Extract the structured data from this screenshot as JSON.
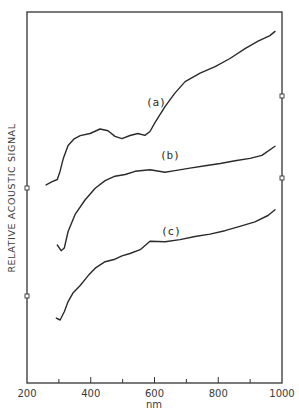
{
  "chart_data": {
    "type": "line",
    "title": "",
    "xlabel": "nm",
    "ylabel": "RELATIVE ACOUSTIC SIGNAL",
    "xlim": [
      200,
      1000
    ],
    "ylim": [
      0,
      100
    ],
    "x_ticks": [
      200,
      400,
      600,
      800,
      1000
    ],
    "x_tick_labels": [
      "200",
      "400",
      "600",
      "800",
      "1000"
    ],
    "x_minor_ticks": [
      300,
      500,
      700,
      900
    ],
    "y_ticks_shown": false,
    "grid": false,
    "legend": "inline labels (a), (b), (c)",
    "series": [
      {
        "name": "(a)",
        "x": [
          260,
          279,
          295,
          304,
          314,
          329,
          348,
          367,
          398,
          429,
          454,
          476,
          498,
          523,
          548,
          570,
          586,
          602,
          633,
          664,
          696,
          743,
          790,
          837,
          884,
          925,
          962,
          978
        ],
        "y": [
          53.4,
          54.4,
          55.0,
          57.1,
          60.4,
          63.9,
          65.8,
          66.8,
          67.4,
          68.5,
          67.9,
          66.3,
          65.8,
          66.8,
          67.4,
          66.8,
          67.7,
          70.1,
          74.4,
          78.2,
          81.4,
          83.6,
          85.2,
          87.3,
          90.0,
          92.2,
          93.8,
          94.9
        ]
      },
      {
        "name": "(b)",
        "x": [
          295,
          307,
          317,
          329,
          351,
          382,
          414,
          445,
          476,
          508,
          539,
          586,
          633,
          664,
          711,
          759,
          806,
          853,
          900,
          937,
          978
        ],
        "y": [
          37.2,
          35.8,
          36.4,
          40.7,
          45.3,
          49.3,
          52.6,
          54.7,
          55.8,
          56.1,
          56.9,
          57.4,
          56.9,
          57.4,
          58.0,
          58.5,
          59.0,
          59.8,
          60.6,
          61.5,
          63.9
        ]
      },
      {
        "name": "(c)",
        "x": [
          292,
          304,
          317,
          329,
          345,
          367,
          392,
          414,
          445,
          476,
          498,
          523,
          555,
          586,
          633,
          680,
          727,
          774,
          821,
          868,
          915,
          956,
          978
        ],
        "y": [
          17.5,
          17.0,
          19.1,
          21.8,
          24.3,
          26.4,
          29.1,
          31.0,
          32.6,
          33.2,
          34.2,
          35.0,
          36.1,
          38.3,
          38.0,
          38.5,
          39.4,
          40.2,
          41.2,
          42.3,
          43.4,
          45.0,
          46.6
        ]
      }
    ],
    "annotations": [
      {
        "text": "(a)",
        "x": 600,
        "y": 76
      },
      {
        "text": "(b)",
        "x": 645,
        "y": 62
      },
      {
        "text": "(c)",
        "x": 648,
        "y": 41
      }
    ],
    "axis_markers": {
      "left_y_px": [
        188,
        296
      ],
      "right_y_px": [
        96,
        178
      ]
    }
  },
  "labels": {
    "xlabel": "nm",
    "ylabel": "RELATIVE ACOUSTIC SIGNAL",
    "x_ticks": [
      "200",
      "400",
      "600",
      "800",
      "1000"
    ],
    "curve_a": "(a)",
    "curve_b": "(b)",
    "curve_c": "(c)"
  },
  "layout": {
    "plot_left": 27,
    "plot_right": 282,
    "plot_top": 12,
    "plot_bottom": 383,
    "line_color": "#2a2a2a",
    "background": "#ffffff"
  }
}
